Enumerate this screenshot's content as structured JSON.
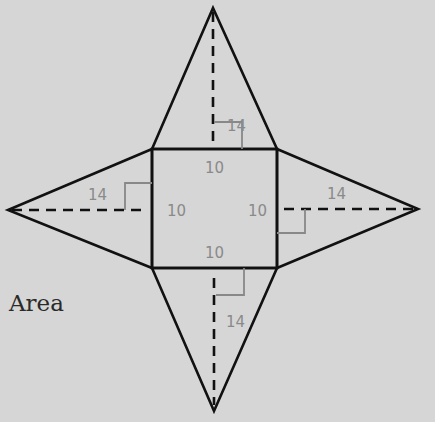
{
  "figure": {
    "type": "net of square pyramid",
    "caption": "Area",
    "colors": {
      "background": "#d6d6d6",
      "outline": "#111111",
      "label": "#8a8a8a",
      "right_angle": "#8a8a8a"
    }
  },
  "square_base": {
    "side_labels": {
      "top": "10",
      "left": "10",
      "right": "10",
      "bottom": "10"
    }
  },
  "triangles": {
    "top": {
      "height_label": "14"
    },
    "left": {
      "height_label": "14"
    },
    "right": {
      "height_label": "14"
    },
    "bottom": {
      "height_label": "14"
    }
  }
}
